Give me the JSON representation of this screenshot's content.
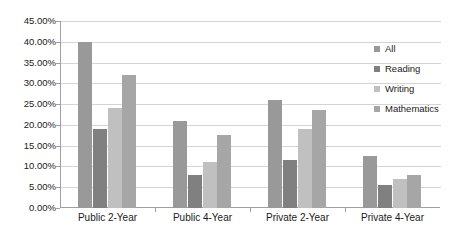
{
  "chart_data": {
    "type": "bar",
    "title": "",
    "xlabel": "",
    "ylabel": "",
    "categories": [
      "Public 2-Year",
      "Public 4-Year",
      "Private 2-Year",
      "Private 4-Year"
    ],
    "series": [
      {
        "name": "All",
        "color": "#999999",
        "values": [
          40.0,
          21.0,
          26.0,
          12.5
        ]
      },
      {
        "name": "Reading",
        "color": "#808080",
        "values": [
          19.0,
          8.0,
          11.5,
          5.5
        ]
      },
      {
        "name": "Writing",
        "color": "#c0c0c0",
        "values": [
          24.0,
          11.0,
          19.0,
          7.0
        ]
      },
      {
        "name": "Mathematics",
        "color": "#a6a6a6",
        "values": [
          32.0,
          17.5,
          23.5,
          8.0
        ]
      }
    ],
    "ylim": [
      0,
      45
    ],
    "ytick_step": 5,
    "ytick_labels": [
      "0.00%",
      "5.00%",
      "10.00%",
      "15.00%",
      "20.00%",
      "25.00%",
      "30.00%",
      "35.00%",
      "40.00%",
      "45.00%"
    ],
    "grid": true,
    "legend_position": "right",
    "background_color": "#ffffff",
    "gridline_color": "#d4d4d4",
    "axis_color": "#a0a0a0"
  }
}
